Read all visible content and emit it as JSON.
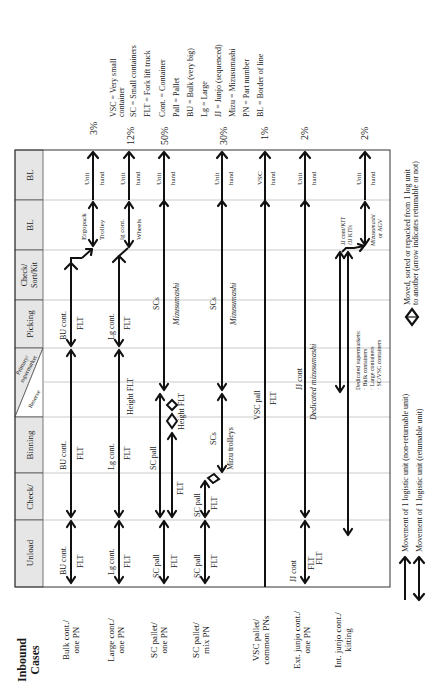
{
  "title": "Inbound Cases",
  "stages": [
    {
      "key": "bl2",
      "label": "BL"
    },
    {
      "key": "bl1",
      "label": "BL"
    },
    {
      "key": "check_sort_kit",
      "label_lines": [
        "Check/",
        "Sort/Kit"
      ]
    },
    {
      "key": "picking",
      "label": "Picking"
    },
    {
      "key": "reserve_primary",
      "label_reserve": "Reserve",
      "label_primary_lines": [
        "Primary/",
        "supermarket"
      ]
    },
    {
      "key": "binning",
      "label": "Binning"
    },
    {
      "key": "check",
      "label": "Check/"
    },
    {
      "key": "unload",
      "label": "Unload"
    }
  ],
  "cases": [
    {
      "label_lines": [
        "Bulk cont./",
        "one PN"
      ],
      "percent": "3%"
    },
    {
      "label_lines": [
        "Large cont./",
        "one PN"
      ],
      "percent": "12%"
    },
    {
      "label_lines": [
        "SC pallet/",
        "one PN"
      ],
      "percent": "50%"
    },
    {
      "label_lines": [
        "SC pallet/",
        "mix PN"
      ],
      "percent": "30%"
    },
    {
      "label_lines": [
        "VSC pallet/",
        "common PNs"
      ],
      "percent": "1%"
    },
    {
      "label_lines": [
        "Ext. junjo cont./",
        "one PN"
      ],
      "percent": "2%"
    },
    {
      "label_lines": [
        "Int. junjo cont./",
        "kitting"
      ],
      "percent": "2%"
    }
  ],
  "flow_labels": {
    "bulk": {
      "unload": [
        "BU cont.",
        "FLT"
      ],
      "binning": [
        "BU cont.",
        "FLT"
      ],
      "picking": [
        "BU cont.",
        "FLT"
      ],
      "bl1": [
        "Ergopack",
        "Trolley"
      ],
      "bl2": [
        "Unit",
        "hand"
      ]
    },
    "large": {
      "unload": [
        "Lg cont.",
        "FLT"
      ],
      "binning": [
        "Lg cont.",
        "FLT"
      ],
      "reserve": "Height FLT",
      "picking": [
        "Lg cont.",
        "FLT"
      ],
      "bl1": [
        "lg cont.",
        "Wheels"
      ],
      "bl2": [
        "Unit",
        "hand"
      ]
    },
    "sc_one": {
      "unload": [
        "SC pall",
        "FLT"
      ],
      "binning": "SC pall",
      "binning_flt": "FLT",
      "reserve": "Height FLT",
      "picking": [
        "SCs",
        "Mizusumashi"
      ],
      "bl2": [
        "Unit",
        "hand"
      ]
    },
    "sc_mix": {
      "unload": [
        "SC pall",
        "FLT"
      ],
      "check": [
        "SC pall",
        "FLT"
      ],
      "binning": [
        "SCs",
        "Mizu trolleys"
      ],
      "picking": [
        "SCs",
        "Mizusumashi"
      ],
      "bl2": [
        "Unit",
        "hand"
      ]
    },
    "vsc": {
      "reserve": [
        "VSC pall",
        "FLT"
      ],
      "bl2": [
        "VSC",
        "hand"
      ]
    },
    "ext_jj": {
      "unload": [
        "JJ cont",
        "FLT",
        "FLT"
      ],
      "reserve": [
        "JJ cont",
        "Dedicated mizusumashi"
      ],
      "bl2": [
        "Unit",
        "hand"
      ]
    },
    "int_jj": {
      "kit": [
        "JJ cont/KIT",
        "/JJ KITs"
      ],
      "bl1": [
        "Mizusumashi",
        "or AGV"
      ],
      "bl2": [
        "Unit",
        "hand"
      ],
      "supermarkets": [
        "Dedicated supermarkets:",
        "· Bulk containers",
        "· Large containers",
        "· SC/VSC containers"
      ]
    }
  },
  "glossary": [
    "VSC = Very small",
    "container",
    "SC = Small containers",
    "FLT = Fork lift truck",
    "Cont. = Container",
    "Pall = Pallet",
    "BU = Bulk (very big)",
    "Lg = Large",
    "JJ = Junjo (sequenced)",
    "Mizu = Mizusumashi",
    "PN = Part number",
    "BL = Border of line"
  ],
  "legend": {
    "non_returnable": "Movement of 1 logistic unit (non-returnable unit)",
    "returnable": "Movement of 1 logistic unit (returnable unit)",
    "repack_line1": "Moved, sorted or repacked from 1 log unit",
    "repack_line2": "to another (arrow indicates returnable or not)"
  }
}
